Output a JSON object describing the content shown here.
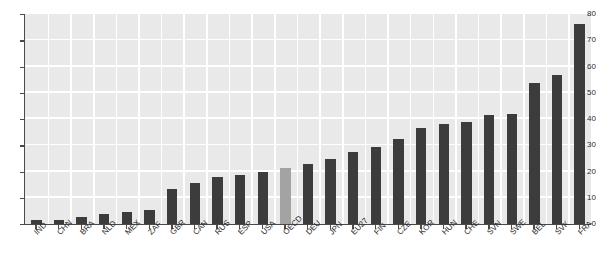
{
  "chart_data": {
    "type": "bar",
    "title": "",
    "subtitle": "",
    "xlabel": "",
    "ylabel": "",
    "ylim": [
      0,
      80
    ],
    "yticks": [
      0,
      10,
      20,
      30,
      40,
      50,
      60,
      70,
      80
    ],
    "ytick_labels": [
      "0",
      "10",
      "20",
      "30",
      "40",
      "50",
      "60",
      "70",
      "80"
    ],
    "grid": true,
    "legend": "none",
    "categories": [
      "IND",
      "CHN",
      "BRA",
      "NLD",
      "MEX",
      "ZAF",
      "GBR",
      "CAN",
      "RUS",
      "ESP",
      "USA",
      "OECD",
      "DEU",
      "JPN",
      "EU27",
      "FIN",
      "CZE",
      "KOR",
      "HUN",
      "CHE",
      "SVN",
      "SWE",
      "BEL",
      "SVK",
      "FRA"
    ],
    "values": [
      1.5,
      1.7,
      2.8,
      3.9,
      4.5,
      5.3,
      13.5,
      15.6,
      17.8,
      18.5,
      19.8,
      21.5,
      22.7,
      24.9,
      27.6,
      29.5,
      32.3,
      36.5,
      38.0,
      38.7,
      41.5,
      41.8,
      53.8,
      56.9,
      76.2
    ],
    "highlight_category": "OECD",
    "colors": {
      "bar": "#3c3c3c",
      "bar_highlight": "#a3a3a3",
      "plot_background": "#e9e9e9",
      "gridline": "#ffffff",
      "axis": "#4a4a4a",
      "text": "#2b2b2b",
      "figure_background": "#ffffff"
    }
  }
}
